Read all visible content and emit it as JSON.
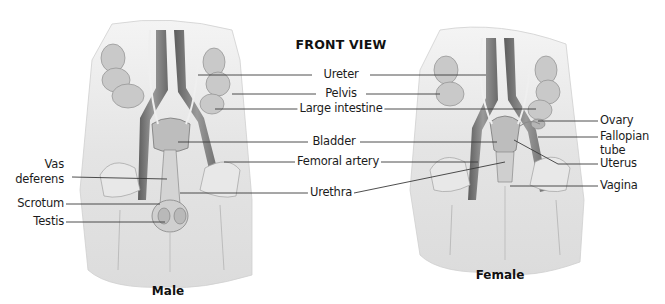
{
  "title": "FRONT VIEW",
  "figures": {
    "male": {
      "caption": "Male"
    },
    "female": {
      "caption": "Female"
    }
  },
  "center_labels": [
    {
      "text": "Ureter"
    },
    {
      "text": "Pelvis"
    },
    {
      "text": "Large intestine"
    },
    {
      "text": "Bladder"
    },
    {
      "text": "Femoral artery"
    },
    {
      "text": "Urethra"
    }
  ],
  "male_labels": [
    {
      "text_line1": "Vas",
      "text_line2": "deferens"
    },
    {
      "text": "Scrotum"
    },
    {
      "text": "Testis"
    }
  ],
  "female_labels": [
    {
      "text": "Ovary"
    },
    {
      "text_line1": "Fallopian",
      "text_line2": "tube"
    },
    {
      "text": "Uterus"
    },
    {
      "text": "Vagina"
    }
  ],
  "colors": {
    "background": "#ffffff",
    "leader_line": "#3a3a3a",
    "skin": "#e6e6e6",
    "tissue_dark": "#8a8a8a"
  }
}
